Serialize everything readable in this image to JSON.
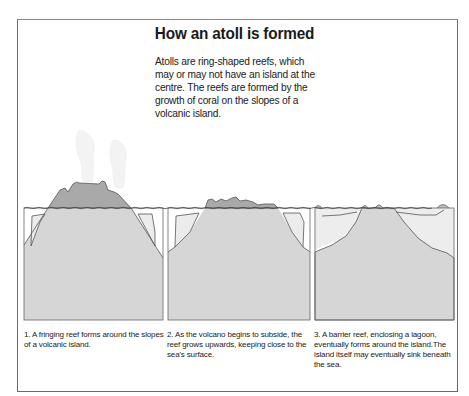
{
  "figure": {
    "title": "How an atoll is formed",
    "intro": "Atolls are ring-shaped reefs, which may or may not have an island at the centre. The reefs are formed by the growth of coral on the slopes of a volcanic island.",
    "colors": {
      "frame": "#6a6a6a",
      "rock": "#d6d6d6",
      "volcano_above_sea": "#a9a9a9",
      "reef": "#ececec",
      "outline": "#555555",
      "smoke": "#f2f2f2"
    },
    "panels": [
      {
        "step": 1,
        "name": "fringing-reef",
        "caption": "1. A fringing reef forms around the slopes of a volcanic island."
      },
      {
        "step": 2,
        "name": "subsiding-volcano",
        "caption": "2. As the volcano begins to subside, the reef grows upwards, keeping close to the sea's surface."
      },
      {
        "step": 3,
        "name": "barrier-reef",
        "caption": "3. A barrier reef, enclosing a lagoon, eventually forms around the island.The island itself may eventually sink beneath the sea."
      }
    ]
  }
}
